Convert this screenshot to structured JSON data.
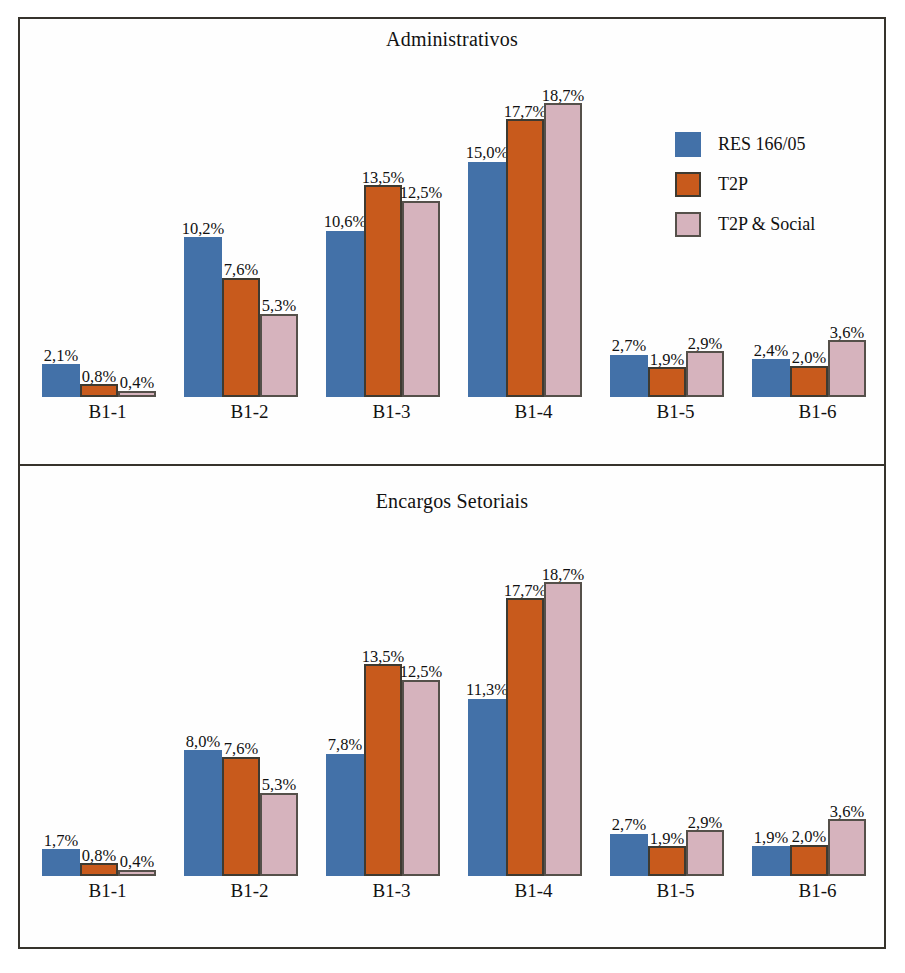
{
  "figure": {
    "frame_color": "#36332c",
    "background": "#ffffff"
  },
  "series_colors": {
    "res": "#4371a8",
    "t2p": "#c85a1c",
    "t2p_social": "#d6b3bd"
  },
  "legend": {
    "entries": [
      {
        "label": "RES 166/05",
        "key": "res"
      },
      {
        "label": "T2P",
        "key": "t2p"
      },
      {
        "label": "T2P & Social",
        "key": "t2p_social"
      }
    ]
  },
  "panels": [
    {
      "id": "top",
      "title": "Administrativos"
    },
    {
      "id": "bottom",
      "title": "Encargos Setoriais"
    }
  ],
  "chart_data": [
    {
      "type": "bar",
      "title": "Administrativos",
      "xlabel": "",
      "ylabel": "",
      "ylim": [
        0,
        20
      ],
      "grid": false,
      "legend_position": "top-right-inside",
      "value_suffix": "%",
      "decimal_separator": ",",
      "categories": [
        "B1-1",
        "B1-2",
        "B1-3",
        "B1-4",
        "B1-5",
        "B1-6"
      ],
      "series": [
        {
          "name": "RES 166/05",
          "color": "#4371a8",
          "values": [
            2.1,
            10.2,
            10.6,
            15.0,
            2.7,
            2.4
          ],
          "labels": [
            "2,1%",
            "10,2%",
            "10,6%",
            "15,0%",
            "2,7%",
            "2,4%"
          ]
        },
        {
          "name": "T2P",
          "color": "#c85a1c",
          "values": [
            0.8,
            7.6,
            13.5,
            17.7,
            1.9,
            2.0
          ],
          "labels": [
            "0,8%",
            "7,6%",
            "13,5%",
            "17,7%",
            "1,9%",
            "2,0%"
          ]
        },
        {
          "name": "T2P & Social",
          "color": "#d6b3bd",
          "values": [
            0.4,
            5.3,
            12.5,
            18.7,
            2.9,
            3.6
          ],
          "labels": [
            "0,4%",
            "5,3%",
            "12,5%",
            "18,7%",
            "2,9%",
            "3,6%"
          ]
        }
      ]
    },
    {
      "type": "bar",
      "title": "Encargos Setoriais",
      "xlabel": "",
      "ylabel": "",
      "ylim": [
        0,
        20
      ],
      "grid": false,
      "legend_position": "top-right-inside",
      "value_suffix": "%",
      "decimal_separator": ",",
      "categories": [
        "B1-1",
        "B1-2",
        "B1-3",
        "B1-4",
        "B1-5",
        "B1-6"
      ],
      "series": [
        {
          "name": "RES 166/05",
          "color": "#4371a8",
          "values": [
            1.7,
            8.0,
            7.8,
            11.3,
            2.7,
            1.9
          ],
          "labels": [
            "1,7%",
            "8,0%",
            "7,8%",
            "11,3%",
            "2,7%",
            "1,9%"
          ]
        },
        {
          "name": "T2P",
          "color": "#c85a1c",
          "values": [
            0.8,
            7.6,
            13.5,
            17.7,
            1.9,
            2.0
          ],
          "labels": [
            "0,8%",
            "7,6%",
            "13,5%",
            "17,7%",
            "1,9%",
            "2,0%"
          ]
        },
        {
          "name": "T2P & Social",
          "color": "#d6b3bd",
          "values": [
            0.4,
            5.3,
            12.5,
            18.7,
            2.9,
            3.6
          ],
          "labels": [
            "0,4%",
            "5,3%",
            "12,5%",
            "18,7%",
            "2,9%",
            "3,6%"
          ]
        }
      ]
    }
  ]
}
